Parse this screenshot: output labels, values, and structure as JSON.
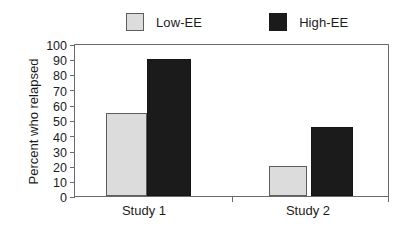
{
  "chart_data": {
    "type": "bar",
    "title": "",
    "xlabel": "",
    "ylabel": "Percent who relapsed",
    "categories": [
      "Study 1",
      "Study 2"
    ],
    "series": [
      {
        "name": "Low-EE",
        "color": "#dcdcdc",
        "values": [
          55,
          20
        ]
      },
      {
        "name": "High-EE",
        "color": "#1b1b1b",
        "values": [
          91,
          46
        ]
      }
    ],
    "ylim": [
      0,
      100
    ],
    "yticks": [
      100,
      90,
      80,
      70,
      60,
      50,
      40,
      30,
      20,
      10,
      0
    ],
    "grid": false,
    "legend_position": "top"
  },
  "legend": {
    "entries": [
      {
        "label": "Low-EE"
      },
      {
        "label": "High-EE"
      }
    ]
  },
  "axes": {
    "y_title": "Percent who relapsed",
    "y_tick_labels": [
      "100",
      "90",
      "80",
      "70",
      "60",
      "50",
      "40",
      "30",
      "20",
      "10",
      "0"
    ],
    "x_tick_labels": [
      "Study 1",
      "Study 2"
    ]
  },
  "colors": {
    "low_ee_fill": "#dcdcdc",
    "high_ee_fill": "#1b1b1b",
    "axis": "#6a6a6a",
    "text": "#1c1c1c",
    "background": "#ffffff"
  }
}
